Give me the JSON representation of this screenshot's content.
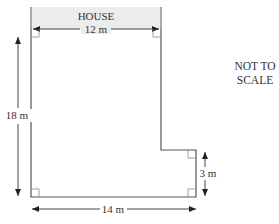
{
  "diagram": {
    "house_label": "HOUSE",
    "note_lines": [
      "NOT TO",
      "SCALE"
    ],
    "dimensions": {
      "top_width": "12 m",
      "left_height": "18 m",
      "bottom_width": "14 m",
      "step_height": "3 m"
    },
    "colors": {
      "outline": "#555555",
      "house_fill": "#ececec",
      "text": "#333333"
    }
  }
}
